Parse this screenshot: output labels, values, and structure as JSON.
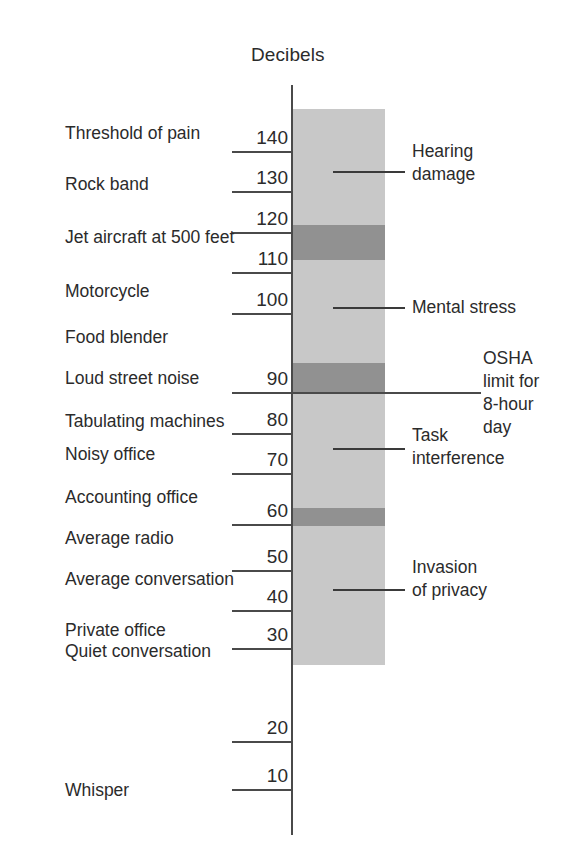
{
  "chart_data": {
    "type": "bar",
    "title": "Decibels",
    "xlabel": "",
    "ylabel": "Decibels",
    "ylim": [
      0,
      150
    ],
    "grid": false,
    "legend": "none",
    "orientation": "vertical-scale",
    "axis_title": "Decibels",
    "tick_labels": [
      "140",
      "130",
      "120",
      "110",
      "100",
      "90",
      "80",
      "70",
      "60",
      "50",
      "40",
      "30",
      "20",
      "10"
    ],
    "tick_values": [
      140,
      130,
      120,
      110,
      100,
      90,
      80,
      70,
      60,
      50,
      40,
      30,
      20,
      10
    ],
    "sources": [
      {
        "label": "Threshold of pain",
        "decibels": 140
      },
      {
        "label": "Rock band",
        "decibels": 130
      },
      {
        "label": "Jet aircraft at 500 feet",
        "decibels": 120
      },
      {
        "label": "Motorcycle",
        "decibels": 110
      },
      {
        "label": "Food blender",
        "decibels": 100
      },
      {
        "label": "Loud street noise",
        "decibels": 90
      },
      {
        "label": "Tabulating machines",
        "decibels": 83
      },
      {
        "label": "Noisy office",
        "decibels": 78
      },
      {
        "label": "Accounting office",
        "decibels": 70
      },
      {
        "label": "Average radio",
        "decibels": 60
      },
      {
        "label": "Average conversation",
        "decibels": 50
      },
      {
        "label": "Private office",
        "decibels": 36
      },
      {
        "label": "Quiet conversation",
        "decibels": 31
      },
      {
        "label": "Whisper",
        "decibels": 10
      }
    ],
    "effect_annotations": [
      {
        "label": "Hearing damage",
        "decibels": 135
      },
      {
        "label": "Mental stress",
        "decibels": 105
      },
      {
        "label": "OSHA limit for 8-hour day",
        "decibels": 90
      },
      {
        "label": "Task interference",
        "decibels": 76
      },
      {
        "label": "Invasion of privacy",
        "decibels": 49
      }
    ],
    "shaded_column": {
      "color": "#c8c8c8",
      "top_decibels": 150,
      "bottom_decibels": 32
    },
    "dark_bands": [
      {
        "color": "#919191",
        "from_decibels": 122,
        "to_decibels": 113
      },
      {
        "color": "#919191",
        "from_decibels": 92,
        "to_decibels": 84
      },
      {
        "color": "#919191",
        "from_decibels": 656,
        "to_decibels": 62
      }
    ]
  },
  "axis": {
    "title": "Decibels",
    "ticks": [
      {
        "label": "140"
      },
      {
        "label": "130"
      },
      {
        "label": "120"
      },
      {
        "label": "110"
      },
      {
        "label": "100"
      },
      {
        "label": "90"
      },
      {
        "label": "80"
      },
      {
        "label": "70"
      },
      {
        "label": "60"
      },
      {
        "label": "50"
      },
      {
        "label": "40"
      },
      {
        "label": "30"
      },
      {
        "label": "20"
      },
      {
        "label": "10"
      }
    ]
  },
  "sources": [
    {
      "label": "Threshold of pain"
    },
    {
      "label": "Rock band"
    },
    {
      "label": "Jet aircraft at 500 feet"
    },
    {
      "label": "Motorcycle"
    },
    {
      "label": "Food blender"
    },
    {
      "label": "Loud street noise"
    },
    {
      "label": "Tabulating machines"
    },
    {
      "label": "Noisy office"
    },
    {
      "label": "Accounting office"
    },
    {
      "label": "Average radio"
    },
    {
      "label": "Average conversation"
    },
    {
      "label": "Private office"
    },
    {
      "label": "Quiet conversation"
    },
    {
      "label": "Whisper"
    }
  ],
  "annotations": [
    {
      "label": "Hearing\ndamage"
    },
    {
      "label": "Mental stress"
    },
    {
      "label": "OSHA\nlimit for\n8-hour\nday"
    },
    {
      "label": "Task\ninterference"
    },
    {
      "label": "Invasion\nof privacy"
    }
  ],
  "colors": {
    "column_light": "#c8c8c8",
    "column_dark": "#919191",
    "axis": "#4a4a4a",
    "text": "#2b2b2b",
    "background": "#ffffff"
  }
}
